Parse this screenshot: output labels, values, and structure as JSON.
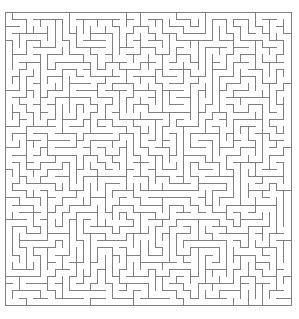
{
  "figure": {
    "kind": "maze-puzzle",
    "width_px": 299,
    "height_px": 319,
    "background_color": "#ffffff"
  },
  "maze": {
    "columns": 40,
    "rows": 41,
    "cell_size_px": 7.15,
    "origin_x_px": 5,
    "origin_y_px": 12,
    "wall_color": "#808080",
    "wall_thickness_px": 1,
    "border_color": "#808080",
    "border_closed": true,
    "entrance": "none-visible",
    "exit": "none-visible",
    "generation": {
      "algorithm": "recursive-backtracker",
      "seed": 20250411,
      "perfect": true
    }
  },
  "labels": {
    "caption": "",
    "axis_x": "",
    "axis_y": ""
  }
}
